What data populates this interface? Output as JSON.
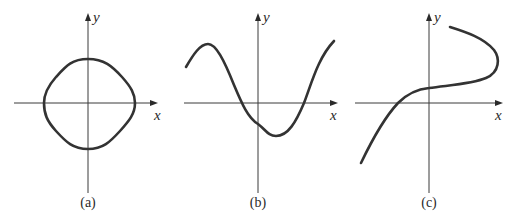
{
  "figure": {
    "panels": [
      {
        "id": "a",
        "label": "(a)",
        "x_axis_label": "x",
        "y_axis_label": "y",
        "curve_description": "closed rounded-square loop centered at origin"
      },
      {
        "id": "b",
        "label": "(b)",
        "x_axis_label": "x",
        "y_axis_label": "y",
        "curve_description": "wave: local max at left, crosses x-axis left of origin, local min right of origin, rises crossing x-axis again"
      },
      {
        "id": "c",
        "label": "(c)",
        "x_axis_label": "x",
        "y_axis_label": "y",
        "curve_description": "S-shaped curve rising from lower-left, flattening near y-axis, bending back to upper-left (fails vertical line test)"
      }
    ],
    "colors": {
      "curve": "#333333",
      "axis": "#3a3a3a",
      "background": "#ffffff"
    }
  }
}
